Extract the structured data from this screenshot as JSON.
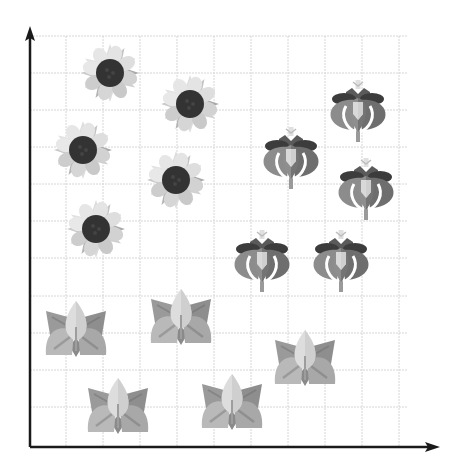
{
  "chart_data": {
    "type": "scatter",
    "title": "",
    "xlabel": "",
    "ylabel": "",
    "grid": true,
    "legend": null,
    "axis": {
      "origin_px": [
        30,
        447
      ],
      "x_end_px": 440,
      "y_end_px": 26,
      "grid_step_px": 37,
      "grid_x_px": [
        66,
        103,
        140,
        177,
        214,
        251,
        288,
        325,
        362,
        399
      ],
      "grid_y_px": [
        36,
        73,
        110,
        147,
        184,
        221,
        258,
        296,
        333,
        370,
        407
      ]
    },
    "series": [
      {
        "name": "sunflower",
        "marker": "sunflower-icon",
        "points": [
          {
            "x": 110,
            "y": 73
          },
          {
            "x": 190,
            "y": 104
          },
          {
            "x": 83,
            "y": 150
          },
          {
            "x": 176,
            "y": 180
          },
          {
            "x": 96,
            "y": 229
          }
        ]
      },
      {
        "name": "tulip",
        "marker": "tulip-icon",
        "points": [
          {
            "x": 358,
            "y": 110
          },
          {
            "x": 291,
            "y": 157
          },
          {
            "x": 366,
            "y": 188
          },
          {
            "x": 262,
            "y": 260
          },
          {
            "x": 341,
            "y": 260
          }
        ]
      },
      {
        "name": "lotus",
        "marker": "lotus-icon",
        "points": [
          {
            "x": 76,
            "y": 331
          },
          {
            "x": 181,
            "y": 319
          },
          {
            "x": 305,
            "y": 360
          },
          {
            "x": 118,
            "y": 408
          },
          {
            "x": 232,
            "y": 404
          }
        ]
      }
    ],
    "colors": {
      "axis": "#1a1a1a",
      "grid": "#d6d6d6",
      "sunflower_disc": "#333333",
      "sunflower_petal_light": "#dcdcdc",
      "sunflower_petal_mid": "#c4c4c4",
      "sunflower_petal_dark": "#a9a9a9",
      "tulip_outer": "#8a8a8a",
      "tulip_outer_dark": "#6e6e6e",
      "tulip_top": "#444444",
      "tulip_center": "#d9d9d9",
      "lotus_leaf_dark": "#9a9a9a",
      "lotus_leaf_mid": "#b5b5b5",
      "lotus_leaf_light": "#dddddd"
    }
  }
}
